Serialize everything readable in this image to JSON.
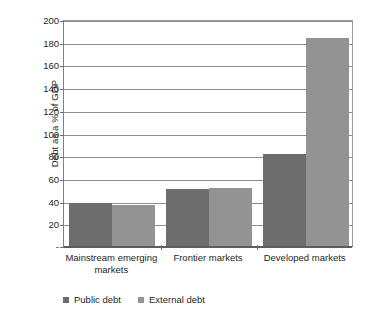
{
  "chart_data": {
    "type": "bar",
    "title": "",
    "subtitle": "",
    "xlabel": "",
    "ylabel": "Debt as a % of GDP",
    "categories": [
      "Mainstream emerging markets",
      "Frontier markets",
      "Developed markets"
    ],
    "series": [
      {
        "name": "Public debt",
        "color": "#6d6d6d",
        "values": [
          38,
          50,
          81
        ]
      },
      {
        "name": "External debt",
        "color": "#939393",
        "values": [
          36,
          51,
          183
        ]
      }
    ],
    "ylim": [
      0,
      200
    ],
    "ytick_step": 20,
    "ytick_labels": [
      "200",
      "180",
      "160",
      "140",
      "120",
      "100",
      "80",
      "60",
      "40",
      "20",
      "-"
    ],
    "ytick_values": [
      200,
      180,
      160,
      140,
      120,
      100,
      80,
      60,
      40,
      20,
      0
    ],
    "grid": true,
    "legend_position": "bottom-left",
    "legend": [
      "Public debt",
      "External debt"
    ],
    "annotations": []
  },
  "colors": {
    "public_debt": "#6d6d6d",
    "external_debt": "#939393",
    "gridline": "#8e8e8e",
    "axis": "#5d5d5d",
    "text": "#231f20",
    "background": "#ffffff"
  }
}
